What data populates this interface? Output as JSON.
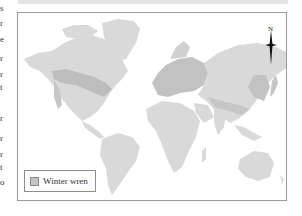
{
  "figure": {
    "type": "world-distribution-map",
    "legend": {
      "items": [
        {
          "label": "Winter wren",
          "swatch_color": "#c4c4c4"
        }
      ]
    },
    "compass": {
      "label": "N"
    },
    "colors": {
      "land": "#d9d9d9",
      "range": "#c2c2c2",
      "ocean": "#ffffff",
      "border": "#9a9a9a",
      "header_bar": "#e3e3e3"
    }
  },
  "left_margin_text": {
    "line_endings": [
      "s",
      "r",
      "e",
      "r",
      "r",
      "t",
      "r",
      "r",
      "r",
      "t",
      "o"
    ]
  }
}
